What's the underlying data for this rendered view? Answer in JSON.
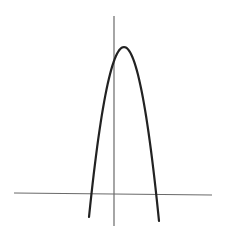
{
  "figure": {
    "colors": {
      "background": "#ffffff",
      "axis": "#6a6a6a",
      "curve": "#222222"
    },
    "axes": {
      "x_axis": {
        "x1": 14,
        "y1": 193,
        "x2": 212,
        "y2": 195
      },
      "y_axis": {
        "x1": 114,
        "y1": 16,
        "x2": 114,
        "y2": 226
      }
    },
    "curve": {
      "type": "parabola",
      "opens": "down",
      "vertex": {
        "x": 124,
        "y": 47
      },
      "y_intercept": {
        "x": 114,
        "y": 60
      },
      "x_intercepts": [
        {
          "x": 92,
          "y": 194
        },
        {
          "x": 157,
          "y": 194
        }
      ],
      "start": {
        "x": 89,
        "y": 217
      },
      "end": {
        "x": 159,
        "y": 221
      }
    }
  }
}
